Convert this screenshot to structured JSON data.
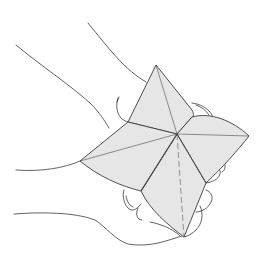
{
  "illustration": {
    "subject": "hands holding a paper fortune teller",
    "background": "#ffffff",
    "paper_fill": "#e6e6e6",
    "line_color": "#3a3a3a",
    "center": [
      177,
      134
    ],
    "tips": {
      "top": [
        156,
        65
      ],
      "right": [
        249,
        136
      ],
      "bottom": [
        184,
        237
      ],
      "left": [
        80,
        161
      ]
    },
    "corners": {
      "top_left": [
        128,
        122
      ],
      "top_right": [
        192,
        117
      ],
      "bottom_right": [
        206,
        183
      ],
      "bottom_left": [
        141,
        191
      ]
    }
  }
}
